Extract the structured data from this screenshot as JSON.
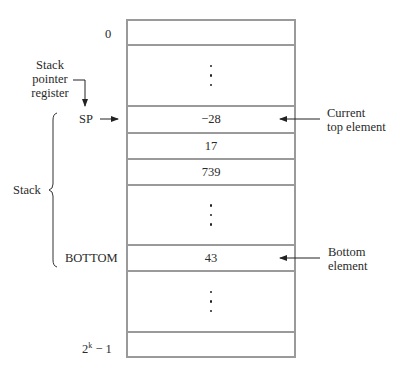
{
  "diagram": {
    "memory_cells": [
      {
        "address_label": "0",
        "value": "",
        "type": "cell"
      },
      {
        "address_label": "",
        "value": "",
        "type": "ellipsis"
      },
      {
        "address_label": "SP",
        "value": "−28",
        "type": "cell"
      },
      {
        "address_label": "",
        "value": "17",
        "type": "cell"
      },
      {
        "address_label": "",
        "value": "739",
        "type": "cell"
      },
      {
        "address_label": "",
        "value": "",
        "type": "ellipsis"
      },
      {
        "address_label": "BOTTOM",
        "value": "43",
        "type": "cell"
      },
      {
        "address_label": "",
        "value": "",
        "type": "ellipsis"
      },
      {
        "address_label": "2^k − 1",
        "value": "",
        "type": "cell"
      }
    ],
    "labels": {
      "address_zero": "0",
      "sp_register_line1": "Stack",
      "sp_register_line2": "pointer",
      "sp_register_line3": "register",
      "sp": "SP",
      "stack": "Stack",
      "bottom": "BOTTOM",
      "last_address_base": "2",
      "last_address_exp": "k",
      "last_address_suffix": "− 1",
      "current_top_line1": "Current",
      "current_top_line2": "top element",
      "bottom_element_line1": "Bottom",
      "bottom_element_line2": "element"
    },
    "values": {
      "top": "−28",
      "second": "17",
      "third": "739",
      "bottom": "43"
    },
    "colors": {
      "box_border": "#9a9a9a",
      "text": "#2a2a2a"
    }
  }
}
